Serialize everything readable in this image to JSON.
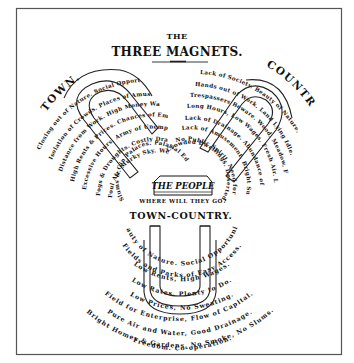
{
  "title": {
    "line1": "THE",
    "line2": "THREE MAGNETS."
  },
  "town": {
    "heading": "TOWN.",
    "rows": [
      "Closing out of Nature. Social Opportunity.",
      "Isolation of Crowds. Places of Amusement.",
      "Distance from Work. High Money Wages.",
      "High Rents & Prices. Chances of Employment.",
      "Excessive Hours. Army of Unemployed.",
      "Fogs & Droughts. Costly Drainage.",
      "Foul Air. Murky Sky. Well-lit Streets.",
      "Slums & Gin Palaces. Palatial Edifices."
    ]
  },
  "country": {
    "heading": "COUNTRY.",
    "rows": [
      "Lack of Society. Beauty of Nature.",
      "Hands out of Work. Land Lying Idle.",
      "Trespassers Beware. Wood, Meadow, Forest.",
      "Long Hours, Low Wages. Fresh Air. Low Rents.",
      "Lack of Drainage. Abundance of Water.",
      "Lack of Amusement. Bright Sunshine.",
      "No Public Spirit. Need for Reform.",
      "Crowded Dwellings. Deserted Villages."
    ]
  },
  "people": {
    "label": "THE PEOPLE",
    "question": "WHERE WILL THEY GO?"
  },
  "town_country": {
    "heading": "TOWN-COUNTRY.",
    "rows": [
      "Beauty of Nature. Social Opportunity.",
      "Fields and Parks of Easy Access.",
      "Low Rents, High Wages.",
      "Low Rates, Plenty to Do.",
      "Low Prices, No Sweating.",
      "Field for Enterprise, Flow of Capital.",
      "Pure Air and Water, Good Drainage.",
      "Bright Homes & Gardens, No Smoke, No Slums.",
      "Freedom. Co-operation."
    ]
  },
  "colors": {
    "ink": "#111111",
    "paper": "#ffffff",
    "frame": "#555555"
  }
}
